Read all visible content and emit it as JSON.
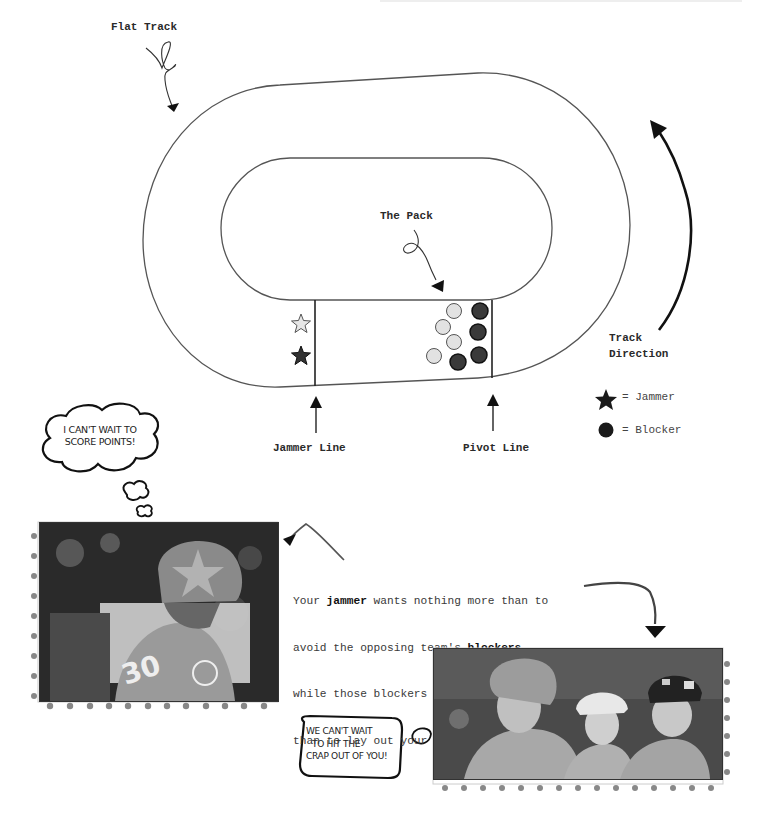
{
  "diagram": {
    "title_labels": {
      "flat_track": "Flat Track",
      "the_pack": "The Pack",
      "track_direction_line1": "Track",
      "track_direction_line2": "Direction",
      "jammer_line": "Jammer Line",
      "pivot_line": "Pivot Line"
    },
    "legend": [
      {
        "symbol": "star-icon",
        "text": "= Jammer",
        "color": "#222222"
      },
      {
        "symbol": "circle-icon",
        "text": "= Blocker",
        "color": "#222222"
      }
    ],
    "players": {
      "jammers": [
        {
          "team": "light",
          "x": 301,
          "y": 324,
          "color": "#e6e6e6"
        },
        {
          "team": "dark",
          "x": 301,
          "y": 356,
          "color": "#333333"
        }
      ],
      "blockers": [
        {
          "team": "light",
          "x": 454,
          "y": 311
        },
        {
          "team": "light",
          "x": 443,
          "y": 327
        },
        {
          "team": "light",
          "x": 454,
          "y": 342
        },
        {
          "team": "light",
          "x": 434,
          "y": 356
        },
        {
          "team": "dark",
          "x": 480,
          "y": 311
        },
        {
          "team": "dark",
          "x": 478,
          "y": 332
        },
        {
          "team": "dark",
          "x": 479,
          "y": 355
        },
        {
          "team": "dark",
          "x": 458,
          "y": 362
        }
      ],
      "colors": {
        "light": "#e2e2e2",
        "dark": "#3a3a3a",
        "stroke": "#222222"
      }
    }
  },
  "captions": {
    "thought_bubble": "I can't wait to score points!",
    "thought_line1": "I CAN'T WAIT TO",
    "thought_line2": "SCORE POINTS!",
    "speech_line1": "WE CAN'T WAIT",
    "speech_line2": "TO HIT THE",
    "speech_line3": "CRAP OUT OF YOU!",
    "body": {
      "line1_a": "Your ",
      "line1_bold": "jammer",
      "line1_b": " wants nothing more than to",
      "line2_a": "avoid the opposing team's ",
      "line2_bold": "blockers",
      "line3": "while those blockers want nothing more",
      "line4": "than to lay out your jammer."
    }
  },
  "photos": [
    {
      "name": "jammer-photo",
      "description": "Skater in helmet with star, jersey number 30"
    },
    {
      "name": "blockers-photo",
      "description": "Three blockers in helmets looking ahead"
    }
  ],
  "photo_texts": {
    "jersey_number": "30"
  }
}
